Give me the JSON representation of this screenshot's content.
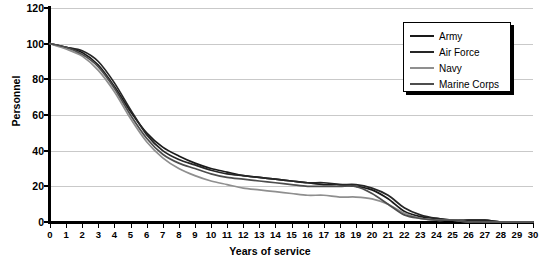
{
  "chart_data": {
    "type": "line",
    "title": "",
    "xlabel": "Years of service",
    "ylabel": "Personnel",
    "xlim": [
      0,
      30
    ],
    "ylim": [
      0,
      120
    ],
    "ytick_step": 20,
    "grid": "horizontal",
    "legend_position": "top-right",
    "xticks": [
      "0",
      "1",
      "2",
      "3",
      "4",
      "5",
      "6",
      "7",
      "8",
      "9",
      "10",
      "11",
      "12",
      "13",
      "14",
      "15",
      "16",
      "17",
      "18",
      "19",
      "20",
      "21",
      "22",
      "23",
      "24",
      "25",
      "26",
      "27",
      "28",
      "29",
      "30"
    ],
    "yticks": [
      "0",
      "20",
      "40",
      "60",
      "80",
      "100",
      "120"
    ],
    "x": [
      0,
      1,
      2,
      3,
      4,
      5,
      6,
      7,
      8,
      9,
      10,
      11,
      12,
      13,
      14,
      15,
      16,
      17,
      18,
      19,
      20,
      21,
      22,
      23,
      24,
      25,
      26,
      27,
      28,
      29,
      30
    ],
    "series": [
      {
        "name": "Army",
        "color": "#1a1a1a",
        "values": [
          100,
          98,
          95,
          88,
          76,
          62,
          50,
          42,
          37,
          33,
          30,
          28,
          26,
          25,
          24,
          23,
          22,
          21,
          21,
          20,
          18,
          13,
          6,
          3,
          2,
          1,
          1,
          1,
          0,
          0,
          0
        ]
      },
      {
        "name": "Air Force",
        "color": "#262626",
        "values": [
          100,
          98,
          96,
          90,
          78,
          63,
          49,
          40,
          35,
          32,
          29,
          27,
          26,
          25,
          24,
          23,
          22,
          22,
          21,
          21,
          19,
          15,
          8,
          4,
          2,
          1,
          1,
          1,
          0,
          0,
          0
        ]
      },
      {
        "name": "Navy",
        "color": "#8f8f8f",
        "values": [
          100,
          97,
          93,
          85,
          73,
          58,
          45,
          36,
          30,
          26,
          23,
          21,
          19,
          18,
          17,
          16,
          15,
          15,
          14,
          14,
          13,
          10,
          5,
          2,
          1,
          1,
          0,
          0,
          0,
          0,
          0
        ]
      },
      {
        "name": "Marine Corps",
        "color": "#4d4d4d",
        "values": [
          100,
          98,
          94,
          87,
          75,
          60,
          47,
          38,
          33,
          30,
          27,
          25,
          24,
          23,
          22,
          21,
          20,
          20,
          20,
          20,
          16,
          10,
          4,
          2,
          1,
          1,
          0,
          0,
          0,
          0,
          0
        ]
      }
    ]
  }
}
